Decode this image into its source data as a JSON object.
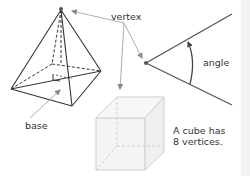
{
  "labels": {
    "vertex": "vertex",
    "angle": "angle",
    "base": "base",
    "cube_note_line1": "A cube has",
    "cube_note_line2": "8 vertices."
  },
  "shapes": [
    "square-based pyramid",
    "angle",
    "cube"
  ],
  "colors": {
    "pyramid_stroke": "#333333",
    "annotation_arrow": "#999999",
    "cube_stroke": "#cccccc",
    "cube_fill": "#f4f4f4",
    "side_panel": "#f2f2f2",
    "text": "#333333"
  }
}
